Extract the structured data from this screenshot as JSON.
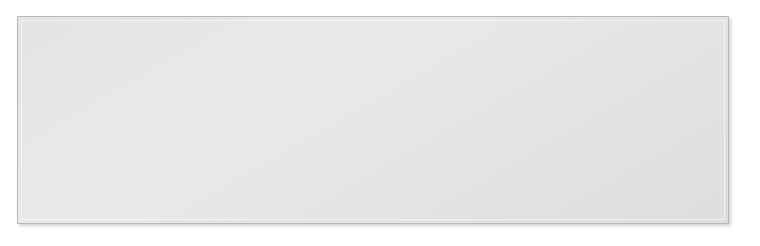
{
  "diagram": {
    "frame": {
      "bg": "#e6e6e6",
      "border": "#b9b9b9"
    },
    "line_color": "#4a4a4a",
    "nodes": [
      {
        "id": "respiratory",
        "label": "Respiratory\nsystem",
        "level": 1,
        "x": 31,
        "y": 96,
        "w": 61,
        "h": 26,
        "fill": "#e0e0e0"
      },
      {
        "id": "cardiovascular",
        "label": "Cardiovascular\nsystem",
        "level": 1,
        "x": 96,
        "y": 96,
        "w": 76,
        "h": 26,
        "fill": "#bdbdbd"
      },
      {
        "id": "digestive",
        "label": "Digestive\nsystem",
        "level": 1,
        "x": 176,
        "y": 96,
        "w": 55,
        "h": 26,
        "fill": "#cfcfcf"
      },
      {
        "id": "immune",
        "label": "Immune\nsystem",
        "level": 1,
        "x": 235,
        "y": 96,
        "w": 51,
        "h": 26,
        "fill": "#e4e4e4"
      },
      {
        "id": "nervous",
        "label": "Nervous\nsystem",
        "level": 1,
        "x": 290,
        "y": 96,
        "w": 54,
        "h": 26,
        "fill": "#e8e8e8"
      },
      {
        "id": "endocrine",
        "label": "Endocrine\nsystem",
        "level": 1,
        "x": 348,
        "y": 96,
        "w": 57,
        "h": 26,
        "fill": "#d2d2d2"
      },
      {
        "id": "reproductive",
        "label": "Reproductive\nsystem",
        "level": 1,
        "x": 409,
        "y": 96,
        "w": 68,
        "h": 26,
        "fill": "#cccccc"
      },
      {
        "id": "urinary",
        "label": "Urinary\nsystem",
        "level": 1,
        "x": 481,
        "y": 96,
        "w": 51,
        "h": 26,
        "fill": "#fbfbfb"
      },
      {
        "id": "integumentary",
        "label": "Integumentary\nsystem",
        "level": 1,
        "x": 536,
        "y": 96,
        "w": 76,
        "h": 26,
        "fill": "#c4c4c4"
      },
      {
        "id": "musculoskeletal",
        "label": "Musculoskeletal\nsystem",
        "level": 1,
        "x": 616,
        "y": 96,
        "w": 82,
        "h": 26,
        "fill": "#b0b0b0"
      },
      {
        "id": "blood-vessels",
        "label": "Blood\nvessels",
        "level": 2,
        "x": 91,
        "y": 146,
        "w": 43,
        "h": 29,
        "fill": "#d9d9d9"
      },
      {
        "id": "heart",
        "label": "Heart",
        "level": 2,
        "x": 140,
        "y": 146,
        "w": 47,
        "h": 29,
        "fill": "#c2c2c2"
      },
      {
        "id": "lymph-nodes",
        "label": "Lymph\nnodes",
        "level": 2,
        "x": 253,
        "y": 146,
        "w": 45,
        "h": 29,
        "fill": "#d7d7d7"
      },
      {
        "id": "brain",
        "label": "Brain",
        "level": 2,
        "x": 311,
        "y": 146,
        "w": 44,
        "h": 29,
        "fill": "#e6e6e6"
      },
      {
        "id": "thyroid-gland",
        "label": "Thyroid\ngland",
        "level": 2,
        "x": 371,
        "y": 146,
        "w": 45,
        "h": 29,
        "fill": "#dcdcdc"
      },
      {
        "id": "bladder",
        "label": "Bladder",
        "level": 2,
        "x": 484,
        "y": 146,
        "w": 44,
        "h": 24,
        "fill": "#fcfcfc"
      },
      {
        "id": "kidneys",
        "label": "Kidneys",
        "level": 2,
        "x": 533,
        "y": 146,
        "w": 45,
        "h": 24,
        "fill": "#fcfcfc"
      },
      {
        "id": "lungs",
        "label": "Lungs",
        "level": 3,
        "x": 35,
        "y": 204,
        "w": 48,
        "h": 24,
        "fill": "#d5d5d5"
      },
      {
        "id": "mouth",
        "label": "Mouth",
        "level": 3,
        "x": 146,
        "y": 204,
        "w": 47,
        "h": 24,
        "fill": "#d5d5d5"
      },
      {
        "id": "stomach",
        "label": "Stomach",
        "level": 3,
        "x": 195,
        "y": 204,
        "w": 52,
        "h": 24,
        "fill": "#cacaca"
      },
      {
        "id": "intestine",
        "label": "Intestine",
        "level": 3,
        "x": 249,
        "y": 204,
        "w": 52,
        "h": 24,
        "fill": "#d5d5d5"
      },
      {
        "id": "testes",
        "label": "Testes",
        "level": 3,
        "x": 404,
        "y": 204,
        "w": 48,
        "h": 24,
        "fill": "#c7c7c7"
      },
      {
        "id": "ovaries",
        "label": "Ovaries",
        "level": 3,
        "x": 455,
        "y": 204,
        "w": 48,
        "h": 24,
        "fill": "#c7c7c7"
      },
      {
        "id": "uterus",
        "label": "Uterus",
        "level": 3,
        "x": 506,
        "y": 204,
        "w": 48,
        "h": 24,
        "fill": "#c7c7c7"
      }
    ],
    "edges": [
      {
        "from": "THE BODY",
        "to": "respiratory"
      },
      {
        "from": "THE BODY",
        "to": "cardiovascular"
      },
      {
        "from": "THE BODY",
        "to": "digestive"
      },
      {
        "from": "THE BODY",
        "to": "immune"
      },
      {
        "from": "THE BODY",
        "to": "nervous"
      },
      {
        "from": "THE BODY",
        "to": "endocrine"
      },
      {
        "from": "THE BODY",
        "to": "reproductive"
      },
      {
        "from": "THE BODY",
        "to": "urinary"
      },
      {
        "from": "THE BODY",
        "to": "integumentary"
      },
      {
        "from": "THE BODY",
        "to": "musculoskeletal"
      },
      {
        "from": "respiratory",
        "to": "lungs"
      },
      {
        "from": "cardiovascular",
        "to": "blood-vessels"
      },
      {
        "from": "cardiovascular",
        "to": "heart"
      },
      {
        "from": "heart",
        "to": "lymph-nodes"
      },
      {
        "from": "digestive",
        "to": "mouth"
      },
      {
        "from": "digestive",
        "to": "stomach"
      },
      {
        "from": "digestive",
        "to": "intestine"
      },
      {
        "from": "digestive",
        "to": "lymph-nodes"
      },
      {
        "from": "immune",
        "to": "lymph-nodes"
      },
      {
        "from": "nervous",
        "to": "brain"
      },
      {
        "from": "endocrine",
        "to": "thyroid-gland"
      },
      {
        "from": "endocrine",
        "to": "testes"
      },
      {
        "from": "endocrine",
        "to": "ovaries"
      },
      {
        "from": "reproductive",
        "to": "testes"
      },
      {
        "from": "reproductive",
        "to": "ovaries"
      },
      {
        "from": "reproductive",
        "to": "uterus"
      },
      {
        "from": "urinary",
        "to": "bladder"
      },
      {
        "from": "urinary",
        "to": "kidneys"
      }
    ]
  }
}
